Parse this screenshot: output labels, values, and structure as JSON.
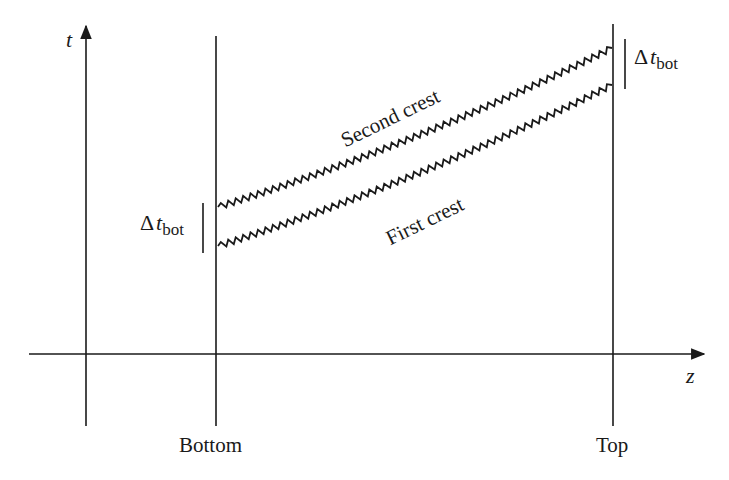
{
  "diagram": {
    "axes": {
      "vertical_label": "t",
      "horizontal_label": "z"
    },
    "positions": {
      "bottom_label": "Bottom",
      "top_label": "Top"
    },
    "annotations": {
      "delta_symbol": "Δ",
      "delta_var": "t",
      "delta_sub": "bot"
    },
    "crests": [
      {
        "name": "Second crest",
        "start": [
          218,
          207
        ],
        "end": [
          612,
          48
        ],
        "bow": 18
      },
      {
        "name": "First crest",
        "start": [
          218,
          246
        ],
        "end": [
          612,
          85
        ],
        "bow": 18
      }
    ],
    "zigzag": {
      "period": 8,
      "amplitude": 3
    },
    "colors": {
      "line": "#1a1a1a",
      "background": "#ffffff"
    }
  }
}
